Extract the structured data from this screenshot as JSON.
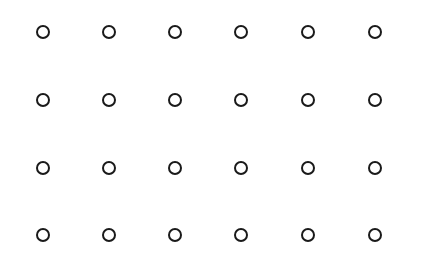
{
  "grid": {
    "rows": 4,
    "cols": 6,
    "col_x": [
      43,
      109,
      175,
      241,
      308,
      375
    ],
    "row_y": [
      32,
      100,
      168,
      235
    ],
    "ring_color": "#1a1a1a",
    "background": "#ffffff",
    "icon": "circle-outline-icon"
  }
}
